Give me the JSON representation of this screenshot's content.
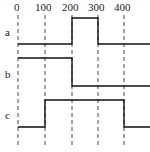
{
  "diagram": {
    "type": "timing-diagram",
    "time_ticks": [
      {
        "label": "0",
        "x": 18
      },
      {
        "label": "100",
        "x": 45
      },
      {
        "label": "200",
        "x": 72
      },
      {
        "label": "300",
        "x": 98
      },
      {
        "label": "400",
        "x": 124
      }
    ],
    "signals": [
      {
        "name": "a",
        "waveform": "low 0-200, high 200-300, low 300-end"
      },
      {
        "name": "b",
        "waveform": "high 0-200, low 200-end"
      },
      {
        "name": "c",
        "waveform": "low 0-100, high 100-400, low 400-end"
      }
    ]
  }
}
